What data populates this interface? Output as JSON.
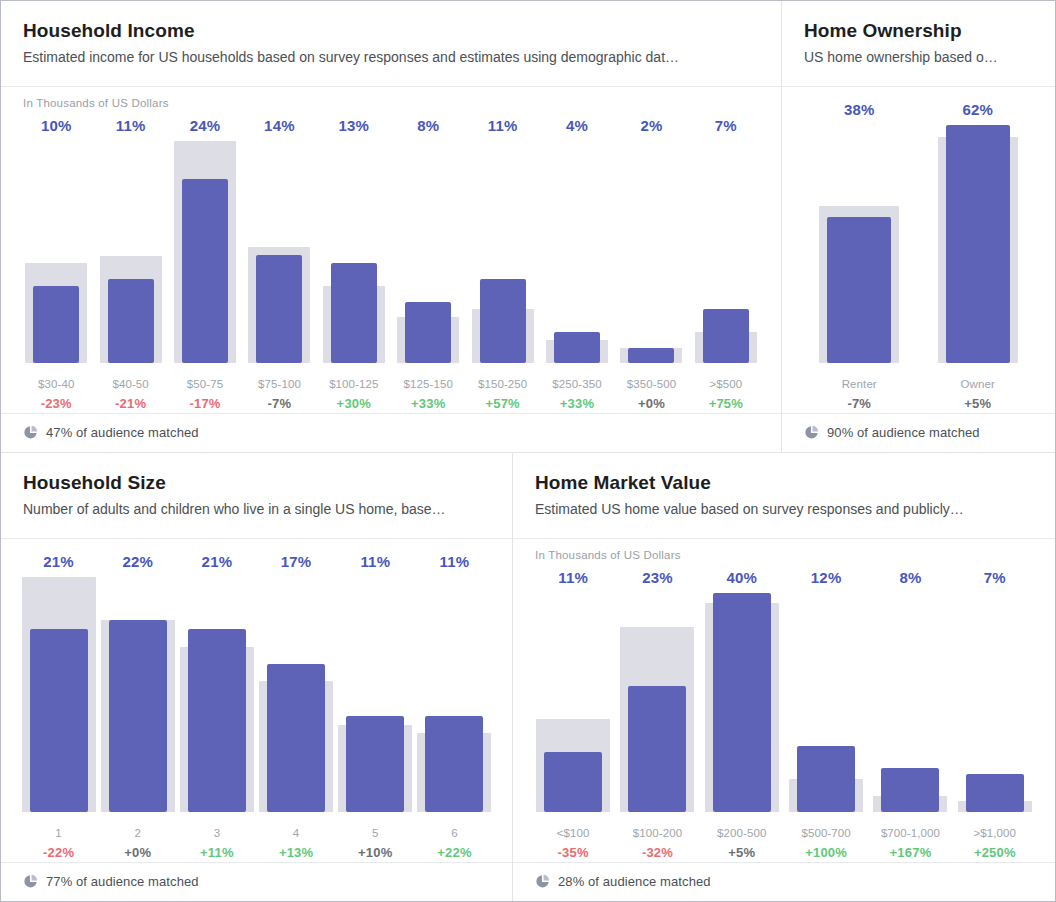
{
  "colors": {
    "bar": "#5f63b8",
    "benchmark": "#dddee5",
    "value_label": "#4857bb",
    "delta_up": "#5fc97a",
    "delta_down": "#ec6a72",
    "delta_flat": "#6b6f76"
  },
  "panels": [
    {
      "id": "household-income",
      "title": "Household Income",
      "subtitle": "Estimated income for US households based on survey responses and estimates using demographic dat…",
      "axis_note": "In Thousands of US Dollars",
      "footer": "47% of audience matched",
      "footer_icon": "pie-chart-icon"
    },
    {
      "id": "home-ownership",
      "title": "Home Ownership",
      "subtitle": "US home ownership based o…",
      "axis_note": "",
      "footer": "90% of audience matched",
      "footer_icon": "pie-chart-icon"
    },
    {
      "id": "household-size",
      "title": "Household Size",
      "subtitle": "Number of adults and children who live in a single US home, base…",
      "axis_note": "",
      "footer": "77% of audience matched",
      "footer_icon": "pie-chart-icon"
    },
    {
      "id": "home-market-value",
      "title": "Home Market Value",
      "subtitle": "Estimated US home value based on survey responses and publicly…",
      "axis_note": "In Thousands of US Dollars",
      "footer": "28% of audience matched",
      "footer_icon": "pie-chart-icon"
    }
  ],
  "chart_data": [
    {
      "type": "bar",
      "title": "Household Income",
      "xlabel": "In Thousands of US Dollars",
      "ylabel": "",
      "ylim": [
        0,
        26
      ],
      "grid": false,
      "legend": "none",
      "categories": [
        "$30-40",
        "$40-50",
        "$50-75",
        "$75-100",
        "$100-125",
        "$125-150",
        "$150-250",
        "$250-350",
        "$350-500",
        ">$500"
      ],
      "values": [
        10,
        11,
        24,
        14,
        13,
        8,
        11,
        4,
        2,
        7
      ],
      "value_labels": [
        "10%",
        "11%",
        "24%",
        "14%",
        "13%",
        "8%",
        "11%",
        "4%",
        "2%",
        "7%"
      ],
      "benchmark": [
        13,
        13.9,
        28.9,
        15.1,
        10,
        6,
        7,
        3,
        2,
        4
      ],
      "deltas": [
        "-23%",
        "-21%",
        "-17%",
        "-7%",
        "+30%",
        "+33%",
        "+57%",
        "+33%",
        "+0%",
        "+75%"
      ],
      "delta_dir": [
        "down",
        "down",
        "down",
        "flat",
        "up",
        "up",
        "up",
        "up",
        "flat",
        "up"
      ]
    },
    {
      "type": "bar",
      "title": "Home Ownership",
      "xlabel": "",
      "ylabel": "",
      "ylim": [
        0,
        66
      ],
      "grid": false,
      "legend": "none",
      "categories": [
        "Renter",
        "Owner"
      ],
      "values": [
        38,
        62
      ],
      "value_labels": [
        "38%",
        "62%"
      ],
      "benchmark": [
        40.9,
        59
      ],
      "deltas": [
        "-7%",
        "+5%"
      ],
      "delta_dir": [
        "flat",
        "flat"
      ]
    },
    {
      "type": "bar",
      "title": "Household Size",
      "xlabel": "",
      "ylabel": "",
      "ylim": [
        0,
        24
      ],
      "grid": false,
      "legend": "none",
      "categories": [
        "1",
        "2",
        "3",
        "4",
        "5",
        "6"
      ],
      "values": [
        21,
        22,
        21,
        17,
        11,
        11
      ],
      "value_labels": [
        "21%",
        "22%",
        "21%",
        "17%",
        "11%",
        "11%"
      ],
      "benchmark": [
        26.9,
        22,
        18.9,
        15,
        10,
        9
      ],
      "deltas": [
        "-22%",
        "+0%",
        "+11%",
        "+13%",
        "+10%",
        "+22%"
      ],
      "delta_dir": [
        "down",
        "flat",
        "up",
        "up",
        "flat",
        "up"
      ]
    },
    {
      "type": "bar",
      "title": "Home Market Value",
      "xlabel": "In Thousands of US Dollars",
      "ylabel": "",
      "ylim": [
        0,
        42
      ],
      "grid": false,
      "legend": "none",
      "categories": [
        "<$100",
        "$100-200",
        "$200-500",
        "$500-700",
        "$700-1,000",
        ">$1,000"
      ],
      "values": [
        11,
        23,
        40,
        12,
        8,
        7
      ],
      "value_labels": [
        "11%",
        "23%",
        "40%",
        "12%",
        "8%",
        "7%"
      ],
      "benchmark": [
        16.9,
        33.8,
        38.1,
        6,
        3,
        2
      ],
      "deltas": [
        "-35%",
        "-32%",
        "+5%",
        "+100%",
        "+167%",
        "+250%"
      ],
      "delta_dir": [
        "down",
        "down",
        "flat",
        "up",
        "up",
        "up"
      ]
    }
  ]
}
